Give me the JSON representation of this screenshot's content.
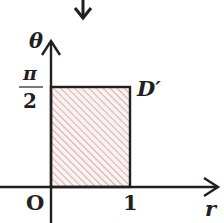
{
  "diagram": {
    "type": "polar-region-rectangle",
    "axes": {
      "vertical": {
        "label": "θ"
      },
      "horizontal": {
        "label": "r"
      },
      "origin_label": "O"
    },
    "ticks": {
      "theta_top": {
        "numerator": "π",
        "denominator": "2"
      },
      "r_right": "1"
    },
    "region": {
      "label": "D′",
      "r_range": [
        0,
        1
      ],
      "theta_range": [
        "0",
        "π/2"
      ],
      "fill": "hatched"
    },
    "indicator": "down-arrow"
  },
  "colors": {
    "ink": "#231f20",
    "hatch": "#c4a4a2",
    "hatch_bg": "#fbf1f0"
  }
}
